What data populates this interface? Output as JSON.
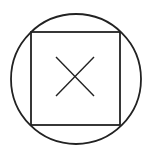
{
  "diagram": {
    "background": "#ffffff",
    "stroke_color": "#222222",
    "shapes": {
      "circle": {
        "cx": 76,
        "cy": 79,
        "r": 65,
        "stroke_width": 1.8
      },
      "square": {
        "x": 31,
        "y": 32,
        "width": 89,
        "height": 93,
        "stroke_width": 1.8
      },
      "cross": {
        "x1": 56,
        "y1": 57,
        "x2": 94,
        "y2": 96,
        "stroke_width": 1.4
      }
    }
  }
}
